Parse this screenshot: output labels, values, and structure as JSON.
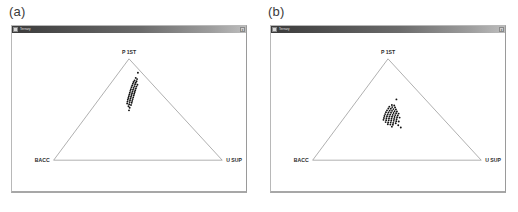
{
  "figure": {
    "background": "#ffffff",
    "panel_count": 2
  },
  "panels": [
    {
      "caption": "(a)",
      "window": {
        "title": "Ternary",
        "icon": "app-icon",
        "close_label": "x",
        "titlebar_color": "#4a4a4a"
      },
      "chart_data": {
        "type": "scatter",
        "subtype": "ternary",
        "title": "",
        "xlabel": "",
        "ylabel": "",
        "grid": false,
        "legend": "none",
        "vertices": [
          {
            "name": "P 1ST",
            "position": "top"
          },
          {
            "name": "BACC",
            "position": "bottom-left"
          },
          {
            "name": "U SUP",
            "position": "bottom-right"
          }
        ],
        "point_color": "#111111",
        "point_count": 46,
        "points": [
          [
            0.5,
            0.863
          ],
          [
            0.487,
            0.812
          ],
          [
            0.495,
            0.8
          ],
          [
            0.48,
            0.786
          ],
          [
            0.492,
            0.779
          ],
          [
            0.474,
            0.771
          ],
          [
            0.487,
            0.764
          ],
          [
            0.47,
            0.755
          ],
          [
            0.483,
            0.749
          ],
          [
            0.497,
            0.744
          ],
          [
            0.466,
            0.737
          ],
          [
            0.479,
            0.731
          ],
          [
            0.491,
            0.726
          ],
          [
            0.462,
            0.719
          ],
          [
            0.475,
            0.713
          ],
          [
            0.488,
            0.708
          ],
          [
            0.458,
            0.701
          ],
          [
            0.471,
            0.696
          ],
          [
            0.484,
            0.69
          ],
          [
            0.455,
            0.684
          ],
          [
            0.468,
            0.678
          ],
          [
            0.481,
            0.673
          ],
          [
            0.452,
            0.666
          ],
          [
            0.465,
            0.661
          ],
          [
            0.478,
            0.655
          ],
          [
            0.449,
            0.648
          ],
          [
            0.462,
            0.643
          ],
          [
            0.475,
            0.638
          ],
          [
            0.446,
            0.631
          ],
          [
            0.459,
            0.626
          ],
          [
            0.472,
            0.62
          ],
          [
            0.443,
            0.613
          ],
          [
            0.456,
            0.608
          ],
          [
            0.469,
            0.603
          ],
          [
            0.44,
            0.596
          ],
          [
            0.453,
            0.591
          ],
          [
            0.466,
            0.585
          ],
          [
            0.438,
            0.578
          ],
          [
            0.451,
            0.573
          ],
          [
            0.463,
            0.567
          ],
          [
            0.436,
            0.559
          ],
          [
            0.448,
            0.552
          ],
          [
            0.459,
            0.544
          ],
          [
            0.444,
            0.532
          ],
          [
            0.451,
            0.517
          ],
          [
            0.447,
            0.492
          ]
        ]
      }
    },
    {
      "caption": "(b)",
      "window": {
        "title": "Ternary",
        "icon": "app-icon",
        "close_label": "x",
        "titlebar_color": "#4a4a4a"
      },
      "chart_data": {
        "type": "scatter",
        "subtype": "ternary",
        "title": "",
        "xlabel": "",
        "ylabel": "",
        "grid": false,
        "legend": "none",
        "vertices": [
          {
            "name": "P 1ST",
            "position": "top"
          },
          {
            "name": "BACC",
            "position": "bottom-left"
          },
          {
            "name": "U SUP",
            "position": "bottom-right"
          }
        ],
        "point_color": "#111111",
        "point_count": 58,
        "points": [
          [
            0.497,
            0.6
          ],
          [
            0.47,
            0.545
          ],
          [
            0.484,
            0.54
          ],
          [
            0.455,
            0.528
          ],
          [
            0.472,
            0.524
          ],
          [
            0.489,
            0.521
          ],
          [
            0.449,
            0.51
          ],
          [
            0.464,
            0.507
          ],
          [
            0.479,
            0.504
          ],
          [
            0.494,
            0.501
          ],
          [
            0.441,
            0.492
          ],
          [
            0.457,
            0.489
          ],
          [
            0.471,
            0.487
          ],
          [
            0.486,
            0.484
          ],
          [
            0.5,
            0.481
          ],
          [
            0.435,
            0.474
          ],
          [
            0.45,
            0.471
          ],
          [
            0.465,
            0.469
          ],
          [
            0.48,
            0.466
          ],
          [
            0.495,
            0.463
          ],
          [
            0.51,
            0.46
          ],
          [
            0.43,
            0.455
          ],
          [
            0.445,
            0.452
          ],
          [
            0.46,
            0.45
          ],
          [
            0.475,
            0.447
          ],
          [
            0.49,
            0.445
          ],
          [
            0.505,
            0.442
          ],
          [
            0.426,
            0.436
          ],
          [
            0.441,
            0.433
          ],
          [
            0.456,
            0.431
          ],
          [
            0.471,
            0.428
          ],
          [
            0.486,
            0.426
          ],
          [
            0.501,
            0.423
          ],
          [
            0.516,
            0.42
          ],
          [
            0.423,
            0.417
          ],
          [
            0.438,
            0.414
          ],
          [
            0.453,
            0.412
          ],
          [
            0.468,
            0.409
          ],
          [
            0.483,
            0.407
          ],
          [
            0.498,
            0.404
          ],
          [
            0.42,
            0.398
          ],
          [
            0.436,
            0.395
          ],
          [
            0.451,
            0.393
          ],
          [
            0.466,
            0.39
          ],
          [
            0.481,
            0.388
          ],
          [
            0.496,
            0.385
          ],
          [
            0.511,
            0.382
          ],
          [
            0.433,
            0.376
          ],
          [
            0.448,
            0.373
          ],
          [
            0.463,
            0.371
          ],
          [
            0.478,
            0.368
          ],
          [
            0.493,
            0.365
          ],
          [
            0.446,
            0.354
          ],
          [
            0.461,
            0.351
          ],
          [
            0.476,
            0.349
          ],
          [
            0.508,
            0.345
          ],
          [
            0.47,
            0.331
          ],
          [
            0.523,
            0.322
          ]
        ]
      }
    }
  ]
}
